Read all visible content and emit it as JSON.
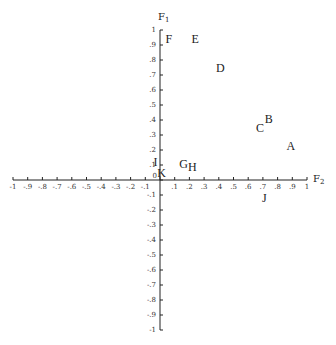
{
  "chart_data": {
    "type": "scatter",
    "title": "",
    "xlabel": "F2",
    "ylabel": "F1",
    "xlim": [
      -1,
      1
    ],
    "ylim": [
      -1,
      1
    ],
    "grid": false,
    "legend": null,
    "x_ticks": [
      "-1",
      "-.9",
      "-.8",
      "-.7",
      "-.6",
      "-.5",
      "-.4",
      "-.3",
      "-.2",
      "-.1",
      "0",
      ".1",
      ".2",
      ".3",
      ".4",
      ".5",
      ".6",
      ".7",
      ".8",
      ".9",
      "1"
    ],
    "y_ticks": [
      "-1",
      "-.9",
      "-.8",
      "-.7",
      "-.6",
      "-.5",
      "-.4",
      "-.3",
      "-.2",
      "-.1",
      "0",
      ".1",
      ".2",
      ".3",
      ".4",
      ".5",
      ".6",
      ".7",
      ".8",
      ".9",
      "1"
    ],
    "points": [
      {
        "label": "A",
        "x": 0.89,
        "y": 0.23
      },
      {
        "label": "B",
        "x": 0.74,
        "y": 0.41
      },
      {
        "label": "C",
        "x": 0.68,
        "y": 0.35
      },
      {
        "label": "D",
        "x": 0.41,
        "y": 0.75
      },
      {
        "label": "E",
        "x": 0.24,
        "y": 0.94
      },
      {
        "label": "F",
        "x": 0.06,
        "y": 0.94
      },
      {
        "label": "G",
        "x": 0.16,
        "y": 0.11
      },
      {
        "label": "H",
        "x": 0.22,
        "y": 0.09
      },
      {
        "label": "I",
        "x": -0.03,
        "y": 0.12
      },
      {
        "label": "J",
        "x": 0.71,
        "y": -0.12
      },
      {
        "label": "K",
        "x": 0.01,
        "y": 0.05
      }
    ]
  },
  "axes": {
    "x_title": "F",
    "x_sub": "2",
    "y_title": "F",
    "y_sub": "1"
  }
}
